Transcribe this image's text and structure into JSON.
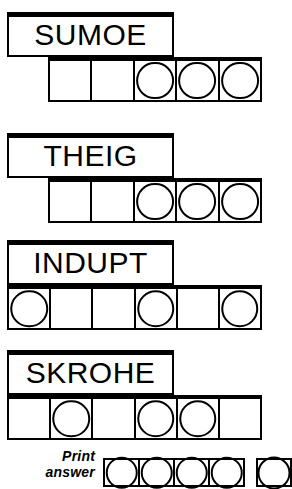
{
  "page": {
    "type": "jumble-word-scramble-puzzle",
    "width": 271,
    "height": 487,
    "ink_color": "#000000",
    "paper_color": "#ffffff"
  },
  "puzzles": [
    {
      "id": "puzzle-1",
      "scrambled_word": "SUMOE",
      "letter_count": 5,
      "word_box": {
        "left": 7,
        "top": 12,
        "width": 167,
        "height": 45
      },
      "answer_row": {
        "left": 48,
        "top": 57,
        "width": 214,
        "height": 45
      },
      "cells": [
        {
          "index": 1,
          "circled": false,
          "letter": ""
        },
        {
          "index": 2,
          "circled": false,
          "letter": ""
        },
        {
          "index": 3,
          "circled": true,
          "letter": ""
        },
        {
          "index": 4,
          "circled": true,
          "letter": ""
        },
        {
          "index": 5,
          "circled": true,
          "letter": ""
        }
      ]
    },
    {
      "id": "puzzle-2",
      "scrambled_word": "THEIG",
      "letter_count": 5,
      "word_box": {
        "left": 7,
        "top": 133,
        "width": 167,
        "height": 45
      },
      "answer_row": {
        "left": 48,
        "top": 178,
        "width": 214,
        "height": 45
      },
      "cells": [
        {
          "index": 1,
          "circled": false,
          "letter": ""
        },
        {
          "index": 2,
          "circled": false,
          "letter": ""
        },
        {
          "index": 3,
          "circled": true,
          "letter": ""
        },
        {
          "index": 4,
          "circled": true,
          "letter": ""
        },
        {
          "index": 5,
          "circled": true,
          "letter": ""
        }
      ]
    },
    {
      "id": "puzzle-3",
      "scrambled_word": "INDUPT",
      "letter_count": 6,
      "word_box": {
        "left": 7,
        "top": 240,
        "width": 167,
        "height": 45
      },
      "answer_row": {
        "left": 7,
        "top": 285,
        "width": 255,
        "height": 45
      },
      "cells": [
        {
          "index": 1,
          "circled": true,
          "letter": ""
        },
        {
          "index": 2,
          "circled": false,
          "letter": ""
        },
        {
          "index": 3,
          "circled": false,
          "letter": ""
        },
        {
          "index": 4,
          "circled": true,
          "letter": ""
        },
        {
          "index": 5,
          "circled": false,
          "letter": ""
        },
        {
          "index": 6,
          "circled": true,
          "letter": ""
        }
      ]
    },
    {
      "id": "puzzle-4",
      "scrambled_word": "SKROHE",
      "letter_count": 6,
      "word_box": {
        "left": 7,
        "top": 350,
        "width": 167,
        "height": 45
      },
      "answer_row": {
        "left": 7,
        "top": 395,
        "width": 255,
        "height": 45
      },
      "cells": [
        {
          "index": 1,
          "circled": false,
          "letter": ""
        },
        {
          "index": 2,
          "circled": true,
          "letter": ""
        },
        {
          "index": 3,
          "circled": false,
          "letter": ""
        },
        {
          "index": 4,
          "circled": true,
          "letter": ""
        },
        {
          "index": 5,
          "circled": true,
          "letter": ""
        },
        {
          "index": 6,
          "circled": false,
          "letter": ""
        }
      ]
    }
  ],
  "print_answer": {
    "label_line_1": "Print",
    "label_line_2": "answer",
    "main_row": {
      "left": 103,
      "top": 458,
      "width": 142,
      "height": 29,
      "cell_count": 4
    },
    "overflow_row": {
      "left": 256,
      "top": 458,
      "width": 36,
      "height": 29,
      "cell_count": 1
    }
  }
}
